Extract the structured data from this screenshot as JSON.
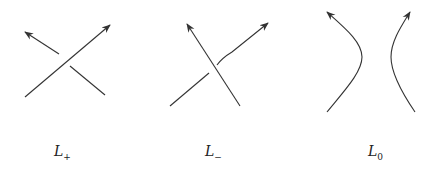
{
  "diagram": {
    "stroke_color": "#333333",
    "panels": [
      {
        "id": "L_plus",
        "label_main": "L",
        "label_sub": "+"
      },
      {
        "id": "L_minus",
        "label_main": "L",
        "label_sub": "−"
      },
      {
        "id": "L_zero",
        "label_main": "L",
        "label_sub": "0"
      }
    ]
  }
}
